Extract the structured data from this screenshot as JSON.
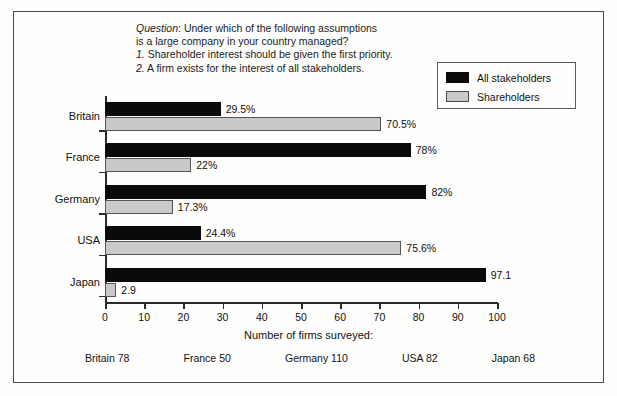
{
  "question": {
    "label": "Question",
    "lines": [
      "Under which of the following assumptions",
      "is a large company in your country managed?",
      "Shareholder interest should be given the first priority.",
      "A firm exists for the interest of all stakeholders."
    ],
    "num1": "1.",
    "num2": "2."
  },
  "legend": {
    "items": [
      {
        "label": "All stakeholders",
        "color": "#0a0a0a"
      },
      {
        "label": "Shareholders",
        "color": "#c9c9c9"
      }
    ]
  },
  "axis": {
    "title": "Number of firms surveyed:",
    "ticks": [
      "0",
      "10",
      "20",
      "30",
      "40",
      "50",
      "60",
      "70",
      "80",
      "90",
      "100"
    ]
  },
  "firms_surveyed": [
    {
      "label": "Britain 78"
    },
    {
      "label": "France 50"
    },
    {
      "label": "Germany 110"
    },
    {
      "label": "USA 82"
    },
    {
      "label": "Japan 68"
    }
  ],
  "chart_data": {
    "type": "bar",
    "orientation": "horizontal",
    "title": "",
    "xlabel": "",
    "ylabel": "",
    "xlim": [
      0,
      100
    ],
    "grid": false,
    "legend_position": "top-right",
    "categories": [
      "Britain",
      "France",
      "Germany",
      "USA",
      "Japan"
    ],
    "series": [
      {
        "name": "All stakeholders",
        "color": "#0a0a0a",
        "values": [
          29.5,
          78,
          82,
          24.4,
          97.1
        ],
        "labels": [
          "29.5%",
          "78%",
          "82%",
          "24.4%",
          "97.1"
        ]
      },
      {
        "name": "Shareholders",
        "color": "#c9c9c9",
        "values": [
          70.5,
          22,
          17.3,
          75.6,
          2.9
        ],
        "labels": [
          "70.5%",
          "22%",
          "17.3%",
          "75.6%",
          "2.9"
        ]
      }
    ]
  }
}
